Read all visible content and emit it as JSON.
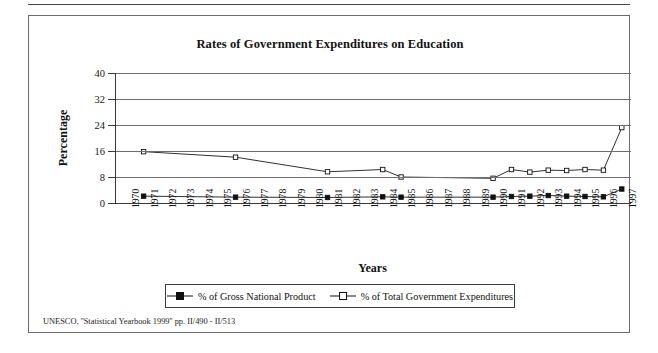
{
  "figure": {
    "source_note": "UNESCO, ''Statistical Yearbook 1999'' pp. II/490 - II/513"
  },
  "chart_data": {
    "type": "line",
    "title": "Rates of Government Expenditures on Education",
    "xlabel": "Years",
    "ylabel": "Percentage",
    "ylim": [
      0,
      40
    ],
    "yticks": [
      0,
      8,
      16,
      24,
      32,
      40
    ],
    "ytick_labels": [
      "0",
      "8",
      "16",
      "24",
      "32",
      "40"
    ],
    "grid": true,
    "legend_position": "bottom",
    "categories": [
      "1970",
      "1971",
      "1972",
      "1973",
      "1974",
      "1975",
      "1976",
      "1977",
      "1978",
      "1979",
      "1980",
      "1981",
      "1982",
      "1983",
      "1984",
      "1985",
      "1986",
      "1987",
      "1988",
      "1989",
      "1990",
      "1991",
      "1992",
      "1993",
      "1994",
      "1995",
      "1996",
      "1997"
    ],
    "series": [
      {
        "name": "% of Gross National Product",
        "marker": "filled-square",
        "values": [
          null,
          2.1,
          null,
          null,
          null,
          null,
          1.8,
          null,
          null,
          null,
          null,
          1.7,
          null,
          null,
          1.9,
          1.8,
          null,
          null,
          null,
          null,
          1.8,
          2.0,
          2.1,
          2.3,
          2.1,
          2.0,
          1.9,
          4.3
        ]
      },
      {
        "name": "% of Total Government Expenditures",
        "marker": "open-square",
        "values": [
          null,
          15.8,
          null,
          null,
          null,
          null,
          14.1,
          null,
          null,
          null,
          null,
          9.6,
          null,
          null,
          10.3,
          8.0,
          null,
          null,
          null,
          null,
          7.6,
          10.3,
          9.5,
          10.1,
          10.0,
          10.3,
          10.1,
          23.2
        ]
      }
    ]
  }
}
